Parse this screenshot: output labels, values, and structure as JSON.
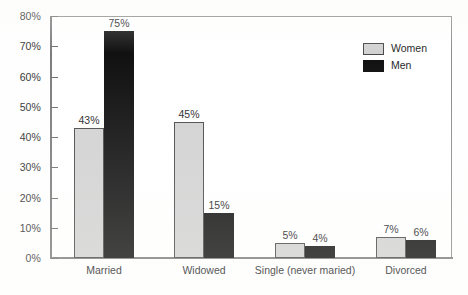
{
  "chart_data": {
    "type": "bar",
    "title": "",
    "xlabel": "",
    "ylabel": "",
    "ylim": [
      0,
      80
    ],
    "ytick_values": [
      0,
      10,
      20,
      30,
      40,
      50,
      60,
      70,
      80
    ],
    "ytick_labels": [
      "0%",
      "10%",
      "20%",
      "30%",
      "40%",
      "50%",
      "60%",
      "70%",
      "80%"
    ],
    "grid": false,
    "legend_position": "top-right",
    "categories": [
      "Married",
      "Widowed",
      "Single (never maried)",
      "Divorced"
    ],
    "series": [
      {
        "name": "Women",
        "color": "#d2d2d2",
        "values": [
          43,
          45,
          5,
          7
        ],
        "value_labels": [
          "43%",
          "45%",
          "5%",
          "7%"
        ]
      },
      {
        "name": "Men",
        "color": "#111111",
        "values": [
          75,
          15,
          4,
          6
        ],
        "value_labels": [
          "75%",
          "15%",
          "4%",
          "6%"
        ]
      }
    ]
  },
  "legend": {
    "items": [
      {
        "label": "Women",
        "swatch": "women"
      },
      {
        "label": "Men",
        "swatch": "men"
      }
    ]
  },
  "colors": {
    "women_fill": "#d2d2d2",
    "men_fill": "#111111",
    "axis": "#7d7d7d",
    "text": "#262626",
    "background": "#ffffff"
  }
}
